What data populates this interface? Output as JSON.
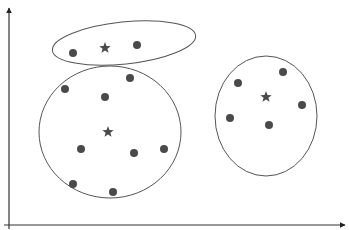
{
  "diagram": {
    "type": "clustering",
    "colors": {
      "background": "#ffffff",
      "axis": "#333333",
      "outline": "#555555",
      "point": "#4a4a4a",
      "centroid": "#4a4a4a"
    },
    "axes": {
      "y": {
        "x": 9,
        "y1": 229,
        "y2": 8
      },
      "x": {
        "y": 225,
        "x1": 4,
        "x2": 345
      }
    },
    "clusters": [
      {
        "id": "top",
        "ellipse": {
          "cx": 124,
          "cy": 43,
          "rx": 72,
          "ry": 21,
          "rotate": -6
        },
        "centroid": {
          "x": 105,
          "y": 48
        },
        "points": [
          {
            "x": 73,
            "y": 53
          },
          {
            "x": 137,
            "y": 45
          }
        ]
      },
      {
        "id": "left",
        "ellipse": {
          "cx": 110,
          "cy": 132,
          "rx": 71,
          "ry": 66,
          "rotate": 0
        },
        "centroid": {
          "x": 108,
          "y": 132
        },
        "points": [
          {
            "x": 65,
            "y": 89
          },
          {
            "x": 130,
            "y": 78
          },
          {
            "x": 105,
            "y": 97
          },
          {
            "x": 81,
            "y": 149
          },
          {
            "x": 134,
            "y": 153
          },
          {
            "x": 164,
            "y": 149
          },
          {
            "x": 73,
            "y": 184
          },
          {
            "x": 113,
            "y": 192
          }
        ]
      },
      {
        "id": "right",
        "ellipse": {
          "cx": 266,
          "cy": 116,
          "rx": 51,
          "ry": 60,
          "rotate": 0
        },
        "centroid": {
          "x": 266,
          "y": 97
        },
        "points": [
          {
            "x": 238,
            "y": 83
          },
          {
            "x": 283,
            "y": 72
          },
          {
            "x": 302,
            "y": 105
          },
          {
            "x": 230,
            "y": 118
          },
          {
            "x": 269,
            "y": 125
          }
        ]
      }
    ],
    "point_radius": 4,
    "centroid_size": 6
  }
}
